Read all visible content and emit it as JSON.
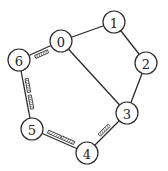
{
  "diagram": {
    "type": "graph",
    "nodes": [
      {
        "id": "0",
        "label": "0",
        "x": 61,
        "y": 41
      },
      {
        "id": "1",
        "label": "1",
        "x": 114,
        "y": 22
      },
      {
        "id": "2",
        "label": "2",
        "x": 146,
        "y": 63
      },
      {
        "id": "3",
        "label": "3",
        "x": 127,
        "y": 113
      },
      {
        "id": "4",
        "label": "4",
        "x": 87,
        "y": 153
      },
      {
        "id": "5",
        "label": "5",
        "x": 32,
        "y": 129
      },
      {
        "id": "6",
        "label": "6",
        "x": 19,
        "y": 60
      }
    ],
    "edges": [
      {
        "from": "0",
        "to": "1",
        "marked": false
      },
      {
        "from": "1",
        "to": "2",
        "marked": false
      },
      {
        "from": "2",
        "to": "3",
        "marked": false
      },
      {
        "from": "0",
        "to": "3",
        "marked": false
      },
      {
        "from": "3",
        "to": "4",
        "marked": true
      },
      {
        "from": "4",
        "to": "5",
        "marked": true
      },
      {
        "from": "5",
        "to": "6",
        "marked": true
      },
      {
        "from": "6",
        "to": "0",
        "marked": true
      }
    ],
    "colors": {
      "stroke": "#2a2a2a",
      "background": "#ffffff"
    }
  }
}
